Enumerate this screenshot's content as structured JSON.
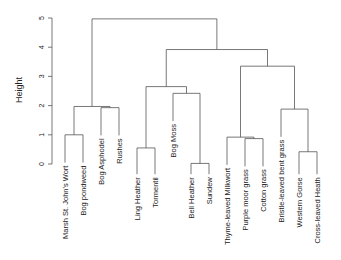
{
  "chart_data": {
    "type": "dendrogram",
    "title": "",
    "xlabel": "",
    "ylabel": "Height",
    "ylim": [
      0,
      5
    ],
    "yticks": [
      0,
      1,
      2,
      3,
      4,
      5
    ],
    "leaves": [
      "Marsh St. John's Wort",
      "Bog pondweed",
      "Bog Asphodel",
      "Rushes",
      "Ling Heather",
      "Tormentil",
      "Bog Moss",
      "Bell Heather",
      "Sundew",
      "Thyme-leaved Milkwort",
      "Purple moor grass",
      "Cotton grass",
      "Bristle-leaved bent grass",
      "Western Gorse",
      "Cross-leaved Heath"
    ],
    "merges": [
      {
        "id": "m1",
        "left": "Marsh St. John's Wort",
        "right": "Bog pondweed",
        "height": 1.0
      },
      {
        "id": "m2",
        "left": "Bog Asphodel",
        "right": "Rushes",
        "height": 1.93
      },
      {
        "id": "m3",
        "left": "m1",
        "right": "m2",
        "height": 1.97
      },
      {
        "id": "m4",
        "left": "Ling Heather",
        "right": "Tormentil",
        "height": 0.55
      },
      {
        "id": "m5",
        "left": "Bell Heather",
        "right": "Sundew",
        "height": 0.02
      },
      {
        "id": "m6",
        "left": "Bog Moss",
        "right": "m5",
        "height": 2.42
      },
      {
        "id": "m7",
        "left": "m4",
        "right": "m6",
        "height": 2.65
      },
      {
        "id": "m8",
        "left": "Purple moor grass",
        "right": "Cotton grass",
        "height": 0.87
      },
      {
        "id": "m9",
        "left": "Thyme-leaved Milkwort",
        "right": "m8",
        "height": 0.92
      },
      {
        "id": "m10",
        "left": "Western Gorse",
        "right": "Cross-leaved Heath",
        "height": 0.42
      },
      {
        "id": "m11",
        "left": "Bristle-leaved bent grass",
        "right": "m10",
        "height": 1.88
      },
      {
        "id": "m12",
        "left": "m9",
        "right": "m11",
        "height": 3.35
      },
      {
        "id": "m13",
        "left": "m7",
        "right": "m12",
        "height": 3.92
      },
      {
        "id": "m14",
        "left": "m3",
        "right": "m13",
        "height": 4.97
      }
    ]
  }
}
